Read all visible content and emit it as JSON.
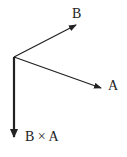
{
  "diagram": {
    "colors": {
      "stroke": "#222222",
      "background": "#ffffff"
    },
    "origin": [
      14,
      57
    ],
    "vectors": [
      {
        "name": "B",
        "label": "B",
        "tip": [
          76,
          25
        ]
      },
      {
        "name": "A",
        "label": "A",
        "tip": [
          101,
          88
        ]
      },
      {
        "name": "BxA",
        "label": "B × A",
        "tip": [
          14,
          137
        ]
      }
    ]
  }
}
